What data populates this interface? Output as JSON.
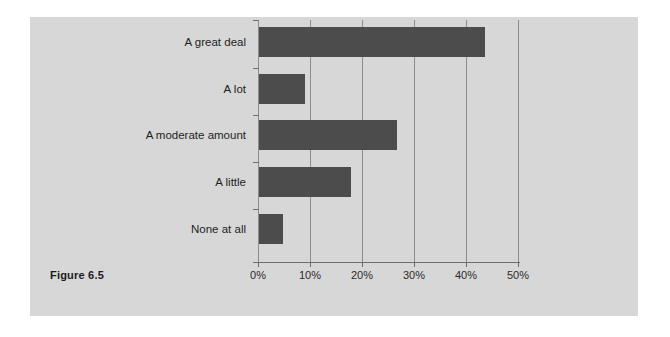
{
  "figure": {
    "caption": "Figure 6.5",
    "panel_color": "#d7d7d7",
    "background_color": "#ffffff"
  },
  "chart_data": {
    "type": "bar",
    "orientation": "horizontal",
    "title": "",
    "xlabel": "",
    "ylabel": "",
    "categories": [
      "A great deal",
      "A lot",
      "A moderate amount",
      "A little",
      "None at all"
    ],
    "values": [
      43.4,
      8.9,
      26.5,
      17.6,
      4.6
    ],
    "value_unit": "%",
    "xlim": [
      0,
      50
    ],
    "xticks": [
      0,
      10,
      20,
      30,
      40,
      50
    ],
    "xtick_labels": [
      "0%",
      "10%",
      "20%",
      "30%",
      "40%",
      "50%"
    ],
    "grid": "vertical",
    "legend": "none",
    "bar_color": "#4c4c4c",
    "gridline_color": "#8d8d8d",
    "axis_color": "#6d6d6d"
  }
}
